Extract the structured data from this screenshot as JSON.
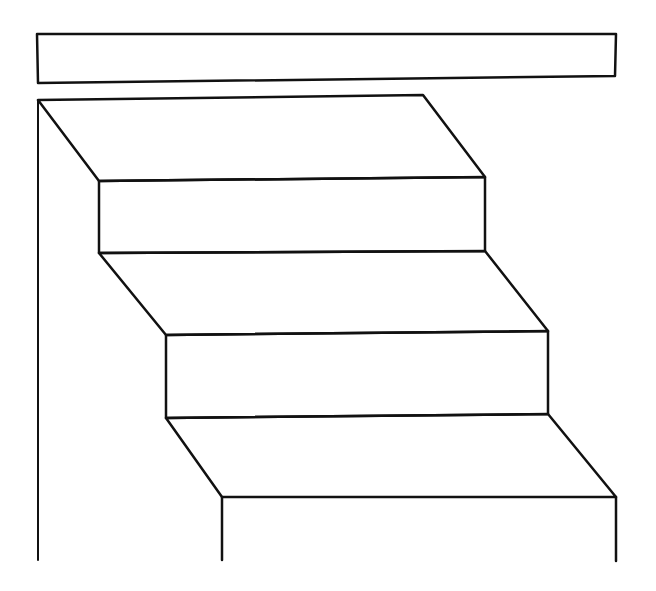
{
  "drawing": {
    "subject": "staircase line drawing",
    "stroke_color": "#111111",
    "background": "#ffffff",
    "ceiling_bar": [
      [
        37,
        34
      ],
      [
        616,
        34
      ],
      [
        615,
        76
      ],
      [
        38,
        83
      ]
    ],
    "wall_line": [
      [
        38,
        100
      ],
      [
        38,
        560
      ]
    ],
    "top_landing": [
      [
        38,
        100
      ],
      [
        423,
        95
      ],
      [
        485,
        177
      ],
      [
        99,
        181
      ]
    ],
    "riser_1": [
      [
        99,
        181
      ],
      [
        485,
        177
      ],
      [
        485,
        251
      ],
      [
        99,
        253
      ]
    ],
    "tread_2": [
      [
        99,
        253
      ],
      [
        485,
        251
      ],
      [
        548,
        331
      ],
      [
        166,
        335
      ]
    ],
    "riser_2": [
      [
        166,
        335
      ],
      [
        548,
        331
      ],
      [
        548,
        414
      ],
      [
        166,
        418
      ]
    ],
    "tread_3": [
      [
        166,
        418
      ],
      [
        548,
        414
      ],
      [
        616,
        497
      ],
      [
        222,
        497
      ]
    ],
    "riser_3_left": [
      [
        222,
        497
      ],
      [
        222,
        560
      ]
    ],
    "riser_3_right": [
      [
        616,
        497
      ],
      [
        616,
        561
      ]
    ]
  }
}
